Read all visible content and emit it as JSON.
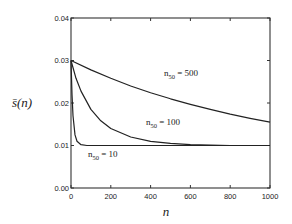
{
  "chart_data": {
    "type": "line",
    "title": "",
    "xlabel": "n",
    "ylabel": "s̄(n)",
    "xlim": [
      0,
      1000
    ],
    "ylim": [
      0.0,
      0.04
    ],
    "x_ticks": [
      "0",
      "200",
      "400",
      "600",
      "800",
      "1000"
    ],
    "y_ticks": [
      "0.00",
      "0.01",
      "0.02",
      "0.03",
      "0.04"
    ],
    "grid": false,
    "legend": "inline labels",
    "series": [
      {
        "name": "n50 = 500",
        "label_main": "n",
        "label_sub": "50",
        "label_rest": " = 500",
        "x": [
          0,
          100,
          200,
          300,
          400,
          500,
          600,
          700,
          800,
          900,
          1000
        ],
        "values": [
          0.03,
          0.0278,
          0.0258,
          0.024,
          0.0224,
          0.021,
          0.0197,
          0.0185,
          0.0174,
          0.0164,
          0.0155
        ]
      },
      {
        "name": "n50 = 100",
        "label_main": "n",
        "label_sub": "50",
        "label_rest": " = 100",
        "x": [
          0,
          25,
          50,
          100,
          150,
          200,
          300,
          400,
          500,
          600,
          800,
          1000
        ],
        "values": [
          0.03,
          0.0258,
          0.0228,
          0.0185,
          0.0158,
          0.014,
          0.012,
          0.011,
          0.0105,
          0.0102,
          0.01,
          0.01
        ]
      },
      {
        "name": "n50 = 10",
        "label_main": "n",
        "label_sub": "50",
        "label_rest": " = 10",
        "x": [
          0,
          5,
          10,
          20,
          30,
          50,
          80,
          100,
          200,
          1000
        ],
        "values": [
          0.03,
          0.022,
          0.017,
          0.0125,
          0.011,
          0.0102,
          0.01,
          0.01,
          0.01,
          0.01
        ]
      }
    ]
  }
}
